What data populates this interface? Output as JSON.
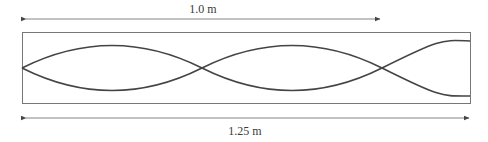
{
  "diagram": {
    "type": "standing-wave",
    "dimensions": {
      "top": {
        "label": "1.0 m"
      },
      "bottom": {
        "label": "1.25 m"
      }
    },
    "colors": {
      "stroke": "#444444",
      "box": "#666666",
      "arrow": "#555555",
      "text": "#3a3a3a"
    }
  }
}
